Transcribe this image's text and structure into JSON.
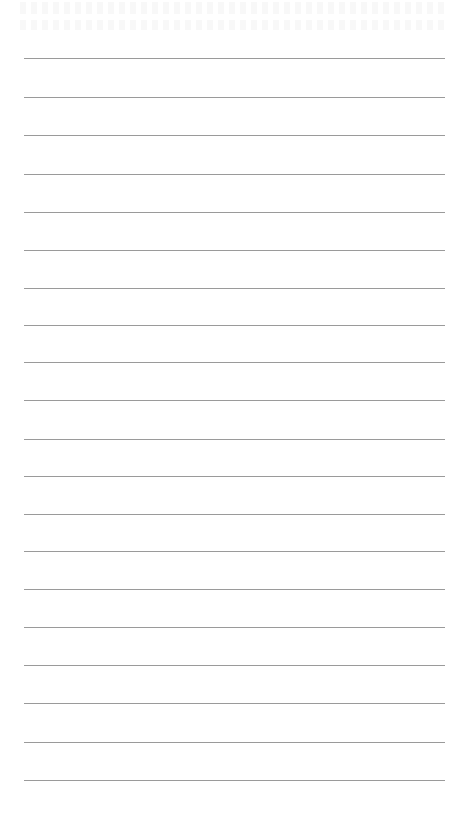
{
  "page": {
    "type": "lined-paper",
    "background_color": "#ffffff",
    "rule_color": "#9a9a9a",
    "rule_count": 20,
    "rules": [
      {
        "y": 58
      },
      {
        "y": 97
      },
      {
        "y": 135
      },
      {
        "y": 174
      },
      {
        "y": 212
      },
      {
        "y": 250
      },
      {
        "y": 288
      },
      {
        "y": 325
      },
      {
        "y": 362
      },
      {
        "y": 400
      },
      {
        "y": 439
      },
      {
        "y": 476
      },
      {
        "y": 514
      },
      {
        "y": 551
      },
      {
        "y": 589
      },
      {
        "y": 627
      },
      {
        "y": 665
      },
      {
        "y": 703
      },
      {
        "y": 742
      },
      {
        "y": 780
      }
    ]
  }
}
